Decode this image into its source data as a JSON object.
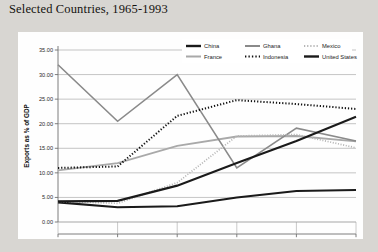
{
  "page": {
    "title": "Selected Countries, 1965-1993",
    "background_color": "#d8d6d2",
    "card_color": "#fefefe"
  },
  "chart_data": {
    "type": "line",
    "title": "Selected Countries, 1965-1993",
    "xlabel": "",
    "ylabel": "Exports as % of GDP",
    "x": [
      "1965*",
      "1970",
      "1978",
      "1983",
      "1988",
      "1993"
    ],
    "xticklabels": [
      "1965*",
      "1970",
      "1978",
      "1983",
      "1988",
      "1993"
    ],
    "yticklabels": [
      "0.00",
      "5.00",
      "10.00",
      "15.00",
      "20.00",
      "25.00",
      "30.00",
      "35.00"
    ],
    "ytickvalues": [
      0,
      5,
      10,
      15,
      20,
      25,
      30,
      35
    ],
    "ylim": [
      0,
      35
    ],
    "grid": true,
    "grid_axis": "y",
    "legend_position": "top-right-inside",
    "series": [
      {
        "name": "China",
        "values": [
          4.0,
          3.0,
          3.2,
          5.0,
          6.3,
          6.5
        ],
        "color": "#1a1a1a",
        "style": "solid",
        "width": 2.1
      },
      {
        "name": "France",
        "values": [
          10.5,
          12.0,
          15.5,
          17.4,
          17.5,
          16.4
        ],
        "color": "#a9a9a9",
        "style": "solid",
        "width": 1.8
      },
      {
        "name": "Ghana",
        "values": [
          32.0,
          20.5,
          30.0,
          11.0,
          19.1,
          16.5
        ],
        "color": "#8a8a8a",
        "style": "solid",
        "width": 1.6
      },
      {
        "name": "Indonesia",
        "values": [
          11.0,
          11.3,
          21.6,
          24.8,
          24.0,
          23.0
        ],
        "color": "#111111",
        "style": "dotted",
        "width": 2.0
      },
      {
        "name": "Mexico",
        "values": [
          4.2,
          3.8,
          8.0,
          17.5,
          17.8,
          15.1
        ],
        "color": "#b5b5b5",
        "style": "dotted",
        "width": 1.7
      },
      {
        "name": "United States",
        "values": [
          4.2,
          4.3,
          7.4,
          12.0,
          16.5,
          21.4
        ],
        "color": "#1a1a1a",
        "style": "solid",
        "width": 2.1
      }
    ],
    "legend": [
      {
        "label": "China",
        "style": "solid",
        "color": "#1a1a1a",
        "width": 2.4
      },
      {
        "label": "Ghana",
        "style": "solid",
        "color": "#8a8a8a",
        "width": 2.0
      },
      {
        "label": "Mexico",
        "style": "dotted",
        "color": "#b5b5b5",
        "width": 2.0
      },
      {
        "label": "France",
        "style": "solid",
        "color": "#a9a9a9",
        "width": 2.0
      },
      {
        "label": "Indonesia",
        "style": "dotted",
        "color": "#111111",
        "width": 2.2
      },
      {
        "label": "United States",
        "style": "solid",
        "color": "#1a1a1a",
        "width": 2.4
      }
    ]
  }
}
